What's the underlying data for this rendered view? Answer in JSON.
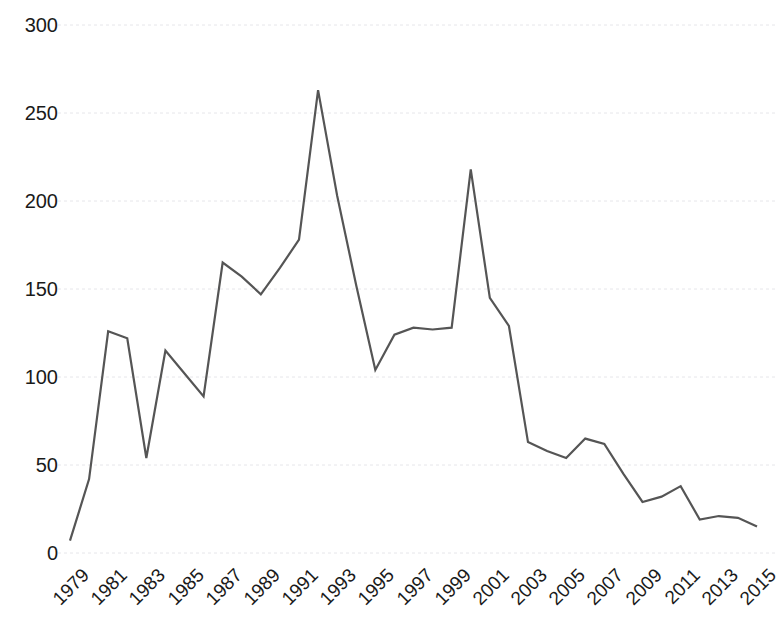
{
  "chart_data": {
    "type": "line",
    "title": "",
    "subtitle": "",
    "xlabel": "",
    "ylabel": "",
    "grid": true,
    "legend": false,
    "legend_position": "none",
    "line_color": "#555555",
    "line_width": 2.2,
    "gridline_color": "#e6e6ea",
    "axis_text_color": "#1a1a1a",
    "background_color": "#ffffff",
    "xlim": [
      1979,
      2015
    ],
    "ylim": [
      0,
      300
    ],
    "y_ticks": [
      0,
      50,
      100,
      150,
      200,
      250,
      300
    ],
    "y_tick_labels": [
      "0",
      "50",
      "100",
      "150",
      "200",
      "250",
      "300"
    ],
    "x_ticks": [
      1979,
      1981,
      1983,
      1985,
      1987,
      1989,
      1991,
      1993,
      1995,
      1997,
      1999,
      2001,
      2003,
      2005,
      2007,
      2009,
      2011,
      2013,
      2015
    ],
    "x_tick_labels": [
      "1979",
      "1981",
      "1983",
      "1985",
      "1987",
      "1989",
      "1991",
      "1993",
      "1995",
      "1997",
      "1999",
      "2001",
      "2003",
      "2005",
      "2007",
      "2009",
      "2011",
      "2013",
      "2015"
    ],
    "x_tick_rotation": -45,
    "x": [
      1979,
      1980,
      1981,
      1982,
      1983,
      1984,
      1985,
      1986,
      1987,
      1988,
      1989,
      1990,
      1991,
      1992,
      1993,
      1994,
      1995,
      1996,
      1997,
      1998,
      1999,
      2000,
      2001,
      2002,
      2003,
      2004,
      2005,
      2006,
      2007,
      2008,
      2009,
      2010,
      2011,
      2012,
      2013,
      2014,
      2015
    ],
    "values": [
      7,
      42,
      126,
      122,
      54,
      115,
      102,
      89,
      165,
      157,
      147,
      162,
      178,
      263,
      203,
      152,
      104,
      124,
      128,
      127,
      128,
      218,
      145,
      129,
      63,
      58,
      54,
      65,
      62,
      45,
      29,
      32,
      38,
      19,
      21,
      20,
      15
    ],
    "series": [
      {
        "name": "",
        "color": "#555555",
        "values": [
          7,
          42,
          126,
          122,
          54,
          115,
          102,
          89,
          165,
          157,
          147,
          162,
          178,
          263,
          203,
          152,
          104,
          124,
          128,
          127,
          128,
          218,
          145,
          129,
          63,
          58,
          54,
          65,
          62,
          45,
          29,
          32,
          38,
          19,
          21,
          20,
          15
        ]
      }
    ],
    "annotations": []
  },
  "layout": {
    "plot_left": 70,
    "plot_right": 757,
    "plot_top": 25,
    "plot_bottom": 553
  }
}
